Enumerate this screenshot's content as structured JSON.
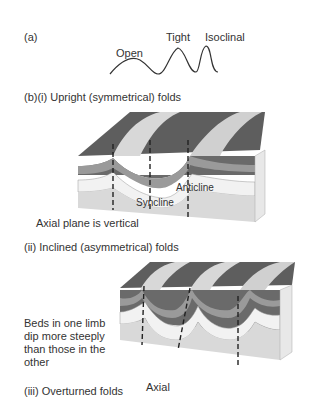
{
  "panel_a": {
    "label": "(a)",
    "fold_types": [
      "Open",
      "Tight",
      "Isoclinal"
    ]
  },
  "panel_b1": {
    "title": "(b)(i) Upright (symmetrical) folds",
    "labels": {
      "anticline": "Anticline",
      "syncline": "Syncline"
    },
    "caption": "Axial plane is vertical"
  },
  "panel_b2": {
    "title": "(ii) Inclined (asymmetrical) folds",
    "caption_lines": [
      "Beds in one limb",
      "dip more steeply",
      "than those in the",
      "other"
    ]
  },
  "panel_b3": {
    "title": "(iii) Overturned folds",
    "axial_label": "Axial"
  },
  "colors": {
    "dark_bed": "#5a5a5a",
    "mid_bed": "#8c8c8c",
    "light_bed": "#bdbdbd",
    "base": "#d9d9d9",
    "side": "#e6e6e6",
    "text": "#333333"
  }
}
